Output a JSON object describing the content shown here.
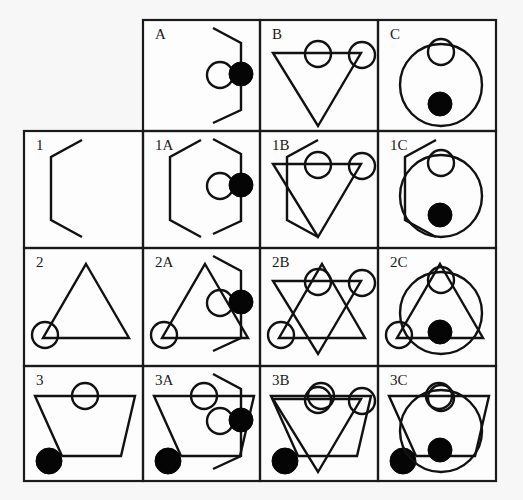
{
  "puzzle": {
    "layout": {
      "columns_x": [
        24,
        143,
        260,
        378,
        496
      ],
      "rows_y": [
        20,
        131,
        248,
        366,
        481
      ]
    },
    "primitives": {
      "A": [
        {
          "type": "polyline",
          "points": [
            [
              70,
              8
            ],
            [
              98,
              23
            ],
            [
              98,
              90
            ],
            [
              70,
              103
            ]
          ]
        },
        {
          "type": "circle",
          "cx": 77,
          "cy": 55,
          "r": 13,
          "filled": false
        },
        {
          "type": "circle",
          "cx": 98,
          "cy": 54,
          "r": 12,
          "filled": true
        }
      ],
      "B": [
        {
          "type": "polygon",
          "points": [
            [
              13,
              33
            ],
            [
              101,
              33
            ],
            [
              58,
              106
            ]
          ]
        },
        {
          "type": "circle",
          "cx": 58,
          "cy": 34,
          "r": 13,
          "filled": false
        },
        {
          "type": "circle",
          "cx": 102,
          "cy": 35,
          "r": 13,
          "filled": false
        }
      ],
      "C": [
        {
          "type": "circle",
          "cx": 63,
          "cy": 65,
          "r": 41,
          "filled": false
        },
        {
          "type": "circle",
          "cx": 63,
          "cy": 32,
          "r": 13,
          "filled": false
        },
        {
          "type": "circle",
          "cx": 62,
          "cy": 84,
          "r": 12,
          "filled": true
        }
      ],
      "1": [
        {
          "type": "polyline",
          "points": [
            [
              58,
              9
            ],
            [
              27,
              26
            ],
            [
              27,
              89
            ],
            [
              58,
              106
            ]
          ]
        }
      ],
      "2": [
        {
          "type": "polygon",
          "points": [
            [
              62,
              16
            ],
            [
              105,
              90
            ],
            [
              19,
              90
            ]
          ]
        },
        {
          "type": "circle",
          "cx": 21,
          "cy": 87,
          "r": 13,
          "filled": false
        }
      ],
      "3": [
        {
          "type": "polyline",
          "points": [
            [
              38,
              90
            ],
            [
              11,
              30
            ],
            [
              111,
              30
            ],
            [
              97,
              90
            ],
            [
              38,
              90
            ]
          ]
        },
        {
          "type": "circle",
          "cx": 61,
          "cy": 30,
          "r": 13,
          "filled": false
        },
        {
          "type": "circle",
          "cx": 25,
          "cy": 95,
          "r": 13,
          "filled": true
        }
      ]
    },
    "cells": [
      {
        "row": 0,
        "col": 1,
        "label": "A",
        "compose": [
          "A"
        ]
      },
      {
        "row": 0,
        "col": 2,
        "label": "B",
        "compose": [
          "B"
        ]
      },
      {
        "row": 0,
        "col": 3,
        "label": "C",
        "compose": [
          "C"
        ]
      },
      {
        "row": 1,
        "col": 0,
        "label": "1",
        "compose": [
          "1"
        ]
      },
      {
        "row": 1,
        "col": 1,
        "label": "1A",
        "compose": [
          "1",
          "A"
        ]
      },
      {
        "row": 1,
        "col": 2,
        "label": "1B",
        "compose": [
          "1",
          "B"
        ]
      },
      {
        "row": 1,
        "col": 3,
        "label": "1C",
        "compose": [
          "1",
          "C"
        ]
      },
      {
        "row": 2,
        "col": 0,
        "label": "2",
        "compose": [
          "2"
        ]
      },
      {
        "row": 2,
        "col": 1,
        "label": "2A",
        "compose": [
          "2",
          "A"
        ]
      },
      {
        "row": 2,
        "col": 2,
        "label": "2B",
        "compose": [
          "2",
          "B"
        ]
      },
      {
        "row": 2,
        "col": 3,
        "label": "2C",
        "compose": [
          "2",
          "C"
        ]
      },
      {
        "row": 3,
        "col": 0,
        "label": "3",
        "compose": [
          "3"
        ]
      },
      {
        "row": 3,
        "col": 1,
        "label": "3A",
        "compose": [
          "3",
          "A"
        ]
      },
      {
        "row": 3,
        "col": 2,
        "label": "3B",
        "compose": [
          "3",
          "B"
        ]
      },
      {
        "row": 3,
        "col": 3,
        "label": "3C",
        "compose": [
          "3",
          "C"
        ]
      }
    ],
    "colors": {
      "line": "#111111",
      "fill_dot": "#050505",
      "background": "#f7f7f7",
      "cell_background": "#fdfdfd"
    }
  }
}
